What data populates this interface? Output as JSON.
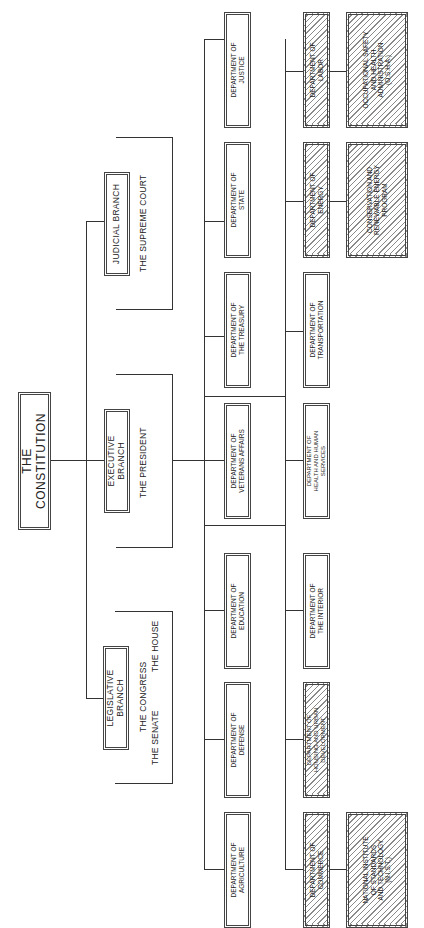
{
  "diagram": {
    "title": "THE CONSTITUTION",
    "orientation": "rotated 90 degrees counter-clockwise",
    "branches": [
      {
        "label": "LEGISLATIVE BRANCH",
        "body": "THE CONGRESS",
        "sub": [
          "THE SENATE",
          "THE HOUSE"
        ]
      },
      {
        "label": "EXECUTIVE BRANCH",
        "body": "THE PRESIDENT"
      },
      {
        "label": "JUDICIAL BRANCH",
        "body": "THE SUPREME COURT"
      }
    ],
    "departments_row1": [
      {
        "label": "DEPARTMENT OF AGRICULTURE",
        "line1": "DEPARTMENT OF",
        "line2": "AGRICULTURE",
        "hatched": false
      },
      {
        "label": "DEPARTMENT OF DEFENSE",
        "line1": "DEPARTMENT OF",
        "line2": "DEFENSE",
        "hatched": false
      },
      {
        "label": "DEPARTMENT OF EDUCATION",
        "line1": "DEPARTMENT OF",
        "line2": "EDUCATION",
        "hatched": false
      },
      {
        "label": "DEPARTMENT OF VETERANS AFFAIRS",
        "line1": "DEPARTMENT OF",
        "line2": "VETERANS AFFAIRS",
        "hatched": false
      },
      {
        "label": "DEPARTMENT OF THE TREASURY",
        "line1": "DEPARTMENT OF",
        "line2": "THE TREASURY",
        "hatched": false
      },
      {
        "label": "DEPARTMENT OF STATE",
        "line1": "DEPARTMENT OF",
        "line2": "STATE",
        "hatched": false
      },
      {
        "label": "DEPARTMENT OF JUSTICE",
        "line1": "DEPARTMENT OF",
        "line2": "JUSTICE",
        "hatched": false
      }
    ],
    "departments_row2": [
      {
        "label": "DEPARTMENT OF COMMERCE",
        "line1": "DEPARTMENT OF",
        "line2": "COMMERCE",
        "hatched": true
      },
      {
        "label": "DEPARTMENT OF HOUSING AND URBAN DEVELOPMENT",
        "line1": "DEPARTMENT OF",
        "line2": "HOUSING AND URBAN",
        "line3": "DEVELOPMENT",
        "hatched": true
      },
      {
        "label": "DEPARTMENT OF THE INTERIOR",
        "line1": "DEPARTMENT OF",
        "line2": "THE INTERIOR",
        "hatched": false
      },
      {
        "label": "DEPARTMENT OF HEALTH AND HUMAN SERVICES",
        "line1": "DEPARTMENT OF",
        "line2": "HEALTH AND HUMAN",
        "line3": "SERVICES",
        "hatched": false
      },
      {
        "label": "DEPARTMENT OF TRANSPORTATION",
        "line1": "DEPARTMENT OF",
        "line2": "TRANSPORTATION",
        "hatched": false
      },
      {
        "label": "DEPARTMENT OF ENERGY",
        "line1": "DEPARTMENT OF",
        "line2": "ENERGY",
        "hatched": true
      },
      {
        "label": "DEPARTMENT OF LABOR",
        "line1": "DEPARTMENT OF",
        "line2": "LABOR",
        "hatched": true
      }
    ],
    "sub_agencies": [
      {
        "parent": "DEPARTMENT OF COMMERCE",
        "lines": [
          "NATIONAL INSTITUTE",
          "OF STANDARDS",
          "AND TECHNOLOGY",
          "(N.I.S.T.)"
        ],
        "hatched": true
      },
      {
        "parent": "DEPARTMENT OF ENERGY",
        "lines": [
          "CONSERVATION AND",
          "RENEWABLE ENERGY",
          "PROGRAM"
        ],
        "hatched": true
      },
      {
        "parent": "DEPARTMENT OF LABOR",
        "lines": [
          "OCCUPATIONAL SAFETY",
          "AND HEALTH",
          "ADMINISTRATION",
          "(O.S.H.A.)"
        ],
        "hatched": true
      }
    ]
  },
  "colors": {
    "line": "#333333",
    "background": "#ffffff",
    "hatch": "#8a8a8a"
  }
}
